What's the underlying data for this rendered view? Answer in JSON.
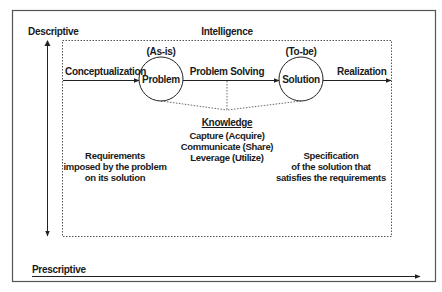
{
  "diagram": {
    "axes": {
      "vertical_top_label": "Descriptive",
      "horizontal_label": "Prescriptive"
    },
    "box_title": "Intelligence",
    "nodes": {
      "problem": {
        "label": "Problem",
        "state": "(As-is)"
      },
      "solution": {
        "label": "Solution",
        "state": "(To-be)"
      }
    },
    "edges": {
      "in": "Conceptualization",
      "middle": "Problem Solving",
      "out": "Realization"
    },
    "knowledge": {
      "title": "Knowledge",
      "items": [
        "Capture (Acquire)",
        "Communicate (Share)",
        "Leverage (Utilize)"
      ]
    },
    "left_note": [
      "Requirements",
      "imposed by the problem",
      "on its solution"
    ],
    "right_note": [
      "Specification",
      "of the solution that",
      "satisfies the requirements"
    ],
    "colors": {
      "line": "#222222",
      "frame": "#555555",
      "dotted": "#444444",
      "background": "#ffffff"
    }
  }
}
